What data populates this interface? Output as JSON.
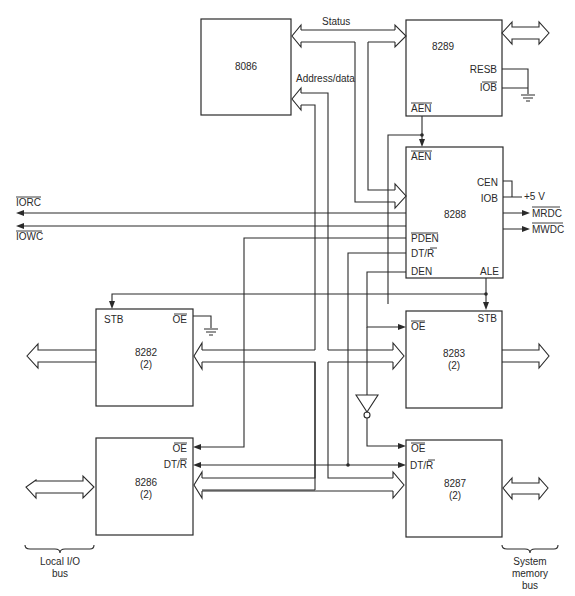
{
  "diagram": {
    "blocks": {
      "cpu": {
        "label": "8086"
      },
      "arbiter": {
        "label": "8289",
        "pins": {
          "resb": "RESB",
          "iob": "IOB",
          "aen": "AEN"
        }
      },
      "bus_controller": {
        "label": "8288",
        "pins": {
          "aen": "AEN",
          "cen": "CEN",
          "iob": "IOB",
          "pden": "PDEN",
          "dtr": "DT/R",
          "den": "DEN",
          "ale": "ALE"
        }
      },
      "latch_local": {
        "label": "8282",
        "count": "(2)",
        "pins": {
          "stb": "STB",
          "oe": "OE"
        }
      },
      "latch_system": {
        "label": "8283",
        "count": "(2)",
        "pins": {
          "stb": "STB",
          "oe": "OE"
        }
      },
      "transceiver_local": {
        "label": "8286",
        "count": "(2)",
        "pins": {
          "oe": "OE",
          "dtr": "DT/R"
        }
      },
      "transceiver_system": {
        "label": "8287",
        "count": "(2)",
        "pins": {
          "oe": "OE",
          "dtr": "DT/R"
        }
      }
    },
    "bus_labels": {
      "status": "Status",
      "address_data": "Address/data"
    },
    "signals": {
      "iorc": "IORC",
      "iowc": "IOWC",
      "mrdc": "MRDC",
      "mwdc": "MWDC",
      "vcc": "+5 V"
    },
    "bus_groups": {
      "local": "Local I/O bus",
      "local_line1": "Local I/O",
      "local_line2": "bus",
      "system_line1": "System",
      "system_line2": "memory",
      "system_line3": "bus"
    },
    "colors": {
      "ink": "#2a2a2a",
      "background": "#ffffff"
    }
  }
}
